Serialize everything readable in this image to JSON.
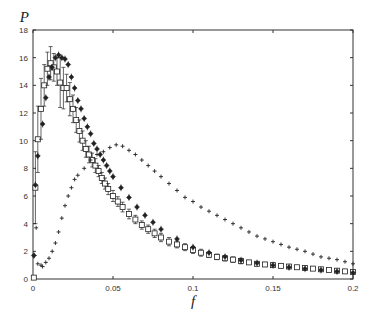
{
  "chart_data": {
    "type": "scatter",
    "title": "",
    "xlabel": "f",
    "ylabel": "P",
    "xlim": [
      0,
      0.2
    ],
    "ylim": [
      0,
      18
    ],
    "xticks": [
      0,
      0.05,
      0.1,
      0.15,
      0.2
    ],
    "xtick_labels": [
      "0",
      "0.05",
      "0.1",
      "0.15",
      "0.2"
    ],
    "yticks": [
      0,
      2,
      4,
      6,
      8,
      10,
      12,
      14,
      16,
      18
    ],
    "ytick_labels": [
      "0",
      "2",
      "4",
      "6",
      "8",
      "10",
      "12",
      "14",
      "16",
      "18"
    ],
    "grid": false,
    "legend": null,
    "series": [
      {
        "name": "squares-with-errorbars",
        "marker": "square",
        "x": [
          0.0005,
          0.0015,
          0.003,
          0.005,
          0.007,
          0.009,
          0.011,
          0.013,
          0.015,
          0.017,
          0.019,
          0.021,
          0.023,
          0.025,
          0.027,
          0.029,
          0.031,
          0.033,
          0.035,
          0.037,
          0.039,
          0.041,
          0.043,
          0.045,
          0.047,
          0.05,
          0.053,
          0.056,
          0.06,
          0.064,
          0.068,
          0.072,
          0.076,
          0.08,
          0.085,
          0.09,
          0.095,
          0.1,
          0.105,
          0.11,
          0.115,
          0.12,
          0.125,
          0.13,
          0.135,
          0.14,
          0.145,
          0.15,
          0.155,
          0.16,
          0.165,
          0.17,
          0.175,
          0.18,
          0.185,
          0.19,
          0.195,
          0.2
        ],
        "y": [
          0.1,
          6.6,
          10.1,
          12.3,
          14.0,
          15.2,
          15.6,
          15.3,
          15.0,
          14.2,
          13.8,
          13.8,
          13.0,
          12.3,
          11.5,
          10.7,
          10.0,
          9.4,
          9.0,
          8.6,
          8.2,
          7.8,
          7.3,
          6.9,
          6.5,
          6.0,
          5.6,
          5.2,
          4.7,
          4.3,
          3.9,
          3.6,
          3.3,
          3.0,
          2.7,
          2.5,
          2.3,
          2.1,
          1.9,
          1.75,
          1.6,
          1.5,
          1.4,
          1.3,
          1.2,
          1.1,
          1.05,
          1.0,
          0.95,
          0.9,
          0.85,
          0.8,
          0.75,
          0.7,
          0.65,
          0.6,
          0.55,
          0.5
        ],
        "err": [
          0,
          2.6,
          2.4,
          2.2,
          1.5,
          1.2,
          1.2,
          1.0,
          1.0,
          1.8,
          1.5,
          1.0,
          1.2,
          1.0,
          0.9,
          0.8,
          0.7,
          0.6,
          0.6,
          0.5,
          0.5,
          0.4,
          0.4,
          0.4,
          0.4,
          0.4,
          0.35,
          0.35,
          0.35,
          0.3,
          0.3,
          0.3,
          0.3,
          0.3,
          0.3,
          0.25,
          0.25,
          0.25,
          0.25,
          0.2,
          0.2,
          0.2,
          0.2,
          0.2,
          0.15,
          0.15,
          0.15,
          0.15,
          0.15,
          0.1,
          0.1,
          0.1,
          0.1,
          0.1,
          0.1,
          0.1,
          0.1,
          0.1
        ]
      },
      {
        "name": "diamonds",
        "marker": "diamond",
        "x": [
          0.0005,
          0.0015,
          0.003,
          0.006,
          0.008,
          0.01,
          0.012,
          0.014,
          0.016,
          0.018,
          0.02,
          0.022,
          0.024,
          0.026,
          0.028,
          0.03,
          0.032,
          0.034,
          0.036,
          0.038,
          0.04,
          0.042,
          0.044,
          0.046,
          0.048,
          0.05,
          0.055,
          0.06,
          0.065,
          0.07,
          0.075,
          0.08,
          0.09,
          0.1,
          0.11,
          0.12,
          0.13,
          0.14,
          0.15,
          0.16,
          0.17,
          0.18,
          0.19,
          0.2
        ],
        "y": [
          1.7,
          6.8,
          8.9,
          11.2,
          13.1,
          14.6,
          15.3,
          16.0,
          16.2,
          16.0,
          15.9,
          15.5,
          14.6,
          13.8,
          12.9,
          12.3,
          11.6,
          11.0,
          10.5,
          9.8,
          9.4,
          9.0,
          8.6,
          8.2,
          7.8,
          7.4,
          6.6,
          5.9,
          5.2,
          4.6,
          4.1,
          3.6,
          2.9,
          2.3,
          1.9,
          1.6,
          1.35,
          1.15,
          1.0,
          0.85,
          0.75,
          0.65,
          0.55,
          0.45
        ]
      },
      {
        "name": "crosses",
        "marker": "plus",
        "x": [
          0.001,
          0.002,
          0.003,
          0.005,
          0.006,
          0.008,
          0.01,
          0.012,
          0.014,
          0.016,
          0.018,
          0.02,
          0.022,
          0.024,
          0.026,
          0.028,
          0.032,
          0.036,
          0.04,
          0.044,
          0.048,
          0.052,
          0.056,
          0.06,
          0.064,
          0.068,
          0.072,
          0.076,
          0.08,
          0.085,
          0.09,
          0.095,
          0.1,
          0.105,
          0.11,
          0.115,
          0.12,
          0.125,
          0.13,
          0.135,
          0.14,
          0.145,
          0.15,
          0.155,
          0.16,
          0.165,
          0.17,
          0.175,
          0.18,
          0.185,
          0.19,
          0.195,
          0.2
        ],
        "y": [
          1.7,
          3.7,
          1.1,
          1.0,
          0.9,
          1.2,
          1.5,
          2.0,
          2.6,
          3.4,
          4.4,
          5.3,
          6.0,
          6.6,
          7.2,
          7.5,
          8.0,
          8.6,
          9.0,
          9.2,
          9.5,
          9.7,
          9.6,
          9.3,
          9.0,
          8.6,
          8.2,
          7.8,
          7.4,
          6.9,
          6.4,
          5.9,
          5.6,
          5.2,
          4.9,
          4.6,
          4.3,
          4.0,
          3.7,
          3.4,
          3.1,
          2.9,
          2.7,
          2.5,
          2.3,
          2.15,
          2.0,
          1.8,
          1.6,
          1.5,
          1.4,
          1.25,
          1.1
        ]
      }
    ]
  },
  "plot": {
    "xlabel": "f",
    "ylabel": "P",
    "xtick_labels": [
      "0",
      "0.05",
      "0.1",
      "0.15",
      "0.2"
    ],
    "ytick_labels": [
      "0",
      "2",
      "4",
      "6",
      "8",
      "10",
      "12",
      "14",
      "16",
      "18"
    ]
  },
  "colors": {
    "ink": "#222222",
    "axis": "#333333",
    "background": "#ffffff"
  }
}
